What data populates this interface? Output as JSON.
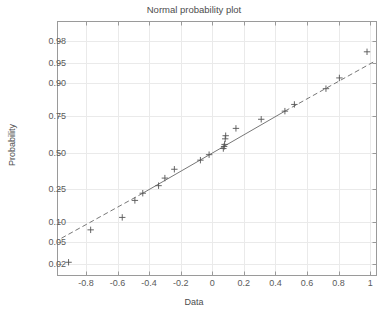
{
  "figure": {
    "title": "Normal probability plot",
    "xlabel": "Data",
    "ylabel": "Probability"
  },
  "chart_data": {
    "type": "scatter",
    "title": "Normal probability plot",
    "xlabel": "Data",
    "ylabel": "Probability",
    "xlim": [
      -0.98,
      1.04
    ],
    "ylim": [
      0.012,
      0.992
    ],
    "grid": true,
    "legend": null,
    "y_scale": "normal-probability",
    "yticks": [
      0.02,
      0.05,
      0.1,
      0.25,
      0.5,
      0.75,
      0.9,
      0.95,
      0.98
    ],
    "ytick_labels": [
      "0.02",
      "0.05",
      "0.10",
      "0.25",
      "0.50",
      "0.75",
      "0.90",
      "0.95",
      "0.98"
    ],
    "xticks": [
      -0.8,
      -0.6,
      -0.4,
      -0.2,
      0,
      0.2,
      0.4,
      0.6,
      0.8,
      1
    ],
    "xtick_labels": [
      "-0.8",
      "-0.6",
      "-0.4",
      "-0.2",
      "0",
      "0.2",
      "0.4",
      "0.6",
      "0.8",
      "1"
    ],
    "marker": "plus",
    "marker_color": "#555555",
    "line_color": "#777777",
    "series": [
      {
        "name": "data",
        "x": [
          -0.91,
          -0.77,
          -0.57,
          -0.49,
          -0.44,
          -0.34,
          -0.3,
          -0.24,
          -0.075,
          -0.02,
          0.07,
          0.075,
          0.078,
          0.082,
          0.085,
          0.15,
          0.31,
          0.46,
          0.52,
          0.72,
          0.805,
          0.98
        ],
        "y": [
          0.022,
          0.078,
          0.117,
          0.19,
          0.228,
          0.272,
          0.32,
          0.38,
          0.445,
          0.485,
          0.53,
          0.545,
          0.56,
          0.6,
          0.622,
          0.672,
          0.73,
          0.777,
          0.812,
          0.88,
          0.915,
          0.968
        ]
      }
    ],
    "reference_line": {
      "style": "solid-center-dashed-ends",
      "x_solid": [
        -0.44,
        0.46
      ],
      "y_solid": [
        0.228,
        0.777
      ],
      "x_dashed_low": [
        -0.955,
        -0.44
      ],
      "y_dashed_low": [
        0.058,
        0.228
      ],
      "x_dashed_high": [
        0.46,
        1.02
      ],
      "y_dashed_high": [
        0.777,
        0.952
      ]
    }
  }
}
